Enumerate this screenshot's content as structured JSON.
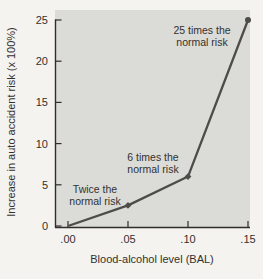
{
  "chart_data": {
    "type": "line",
    "title": "",
    "xlabel": "Blood-alcohol level (BAL)",
    "ylabel": "Increase in auto accident risk (x 100%)",
    "x": [
      0.0,
      0.05,
      0.1,
      0.15
    ],
    "y": [
      0,
      2.5,
      6,
      25
    ],
    "xtick_values": [
      0,
      0.05,
      0.1,
      0.15
    ],
    "xtick_labels": [
      ".00",
      ".05",
      ".10",
      ".15"
    ],
    "ytick_values": [
      0,
      5,
      10,
      15,
      20,
      25
    ],
    "ytick_labels": [
      "0",
      "5",
      "10",
      "15",
      "20",
      "25"
    ],
    "xlim": [
      0,
      0.15
    ],
    "ylim": [
      0,
      25
    ],
    "grid": false,
    "legend": null,
    "annotations": [
      {
        "lines": [
          "Twice the",
          "normal risk"
        ],
        "anchor_px": {
          "x": 95,
          "y": 193
        }
      },
      {
        "lines": [
          "6 times the",
          "normal risk"
        ],
        "anchor_px": {
          "x": 153,
          "y": 161
        }
      },
      {
        "lines": [
          "25 times the",
          "normal risk"
        ],
        "anchor_px": {
          "x": 202,
          "y": 34
        }
      }
    ],
    "colors": {
      "line": "#4e4c49",
      "plot_background": "#dbdcd8",
      "axis": "#2f2e2b",
      "text": "#33312e",
      "page_background": "#f4f3ef"
    }
  }
}
